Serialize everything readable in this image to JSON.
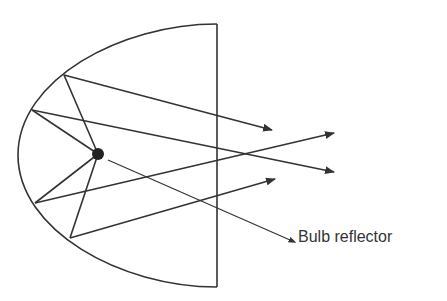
{
  "diagram": {
    "label": "Bulb reflector",
    "colors": {
      "stroke": "#333333",
      "background": "#ffffff"
    },
    "elements": {
      "reflector": "parabolic reflector outline",
      "bulb": "bulb at focal point",
      "rays": 4
    }
  }
}
